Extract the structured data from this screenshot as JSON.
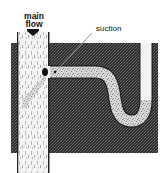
{
  "diagram": {
    "labels": {
      "main_flow_line1": "main",
      "main_flow_line2": "flow",
      "suction": "suction"
    },
    "elements": {
      "tank": "dark stippled water-filled region",
      "main_pipe": "vertical pipe carrying main flow downward",
      "branch_pipe": "horizontal branch pipe with S-curve into U-trap",
      "suction_point": "black mark at junction where suction occurs",
      "flow_arrow": "down-arrow-icon"
    },
    "colors": {
      "tank_fill": "#3a3a3a",
      "pipe_fill": "#f2f2f2",
      "stipple": "#9a9a9a",
      "ink": "#111111"
    }
  }
}
